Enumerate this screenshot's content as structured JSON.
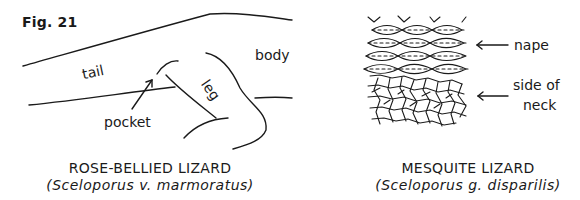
{
  "figure": {
    "number_label": "Fig. 21"
  },
  "left_panel": {
    "labels": {
      "tail": "tail",
      "body": "body",
      "leg": "leg",
      "pocket": "pocket"
    },
    "caption": {
      "common_name": "ROSE-BELLIED LIZARD",
      "scientific_name": "(Sceloporus v. marmoratus)"
    }
  },
  "right_panel": {
    "labels": {
      "nape": "nape",
      "side_of_neck_line1": "side of",
      "side_of_neck_line2": "neck"
    },
    "caption": {
      "common_name": "MESQUITE LIZARD",
      "scientific_name": "(Sceloporus g. disparilis)"
    }
  },
  "colors": {
    "ink": "#1a1a1a",
    "background": "#ffffff"
  }
}
